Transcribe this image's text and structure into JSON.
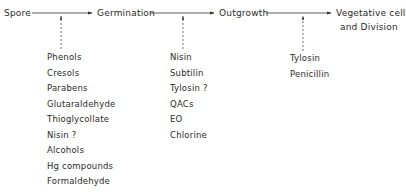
{
  "diagram": {
    "stages": [
      {
        "label": "Spore"
      },
      {
        "label": "Germination"
      },
      {
        "label": "Outgrowth"
      },
      {
        "label_line1": "Vegetative cell",
        "label_line2": "and Division"
      }
    ],
    "inhibitors": {
      "spore_to_germination": [
        "Phenols",
        "Cresols",
        "Parabens",
        "Glutaraldehyde",
        "Thioglycollate",
        "Nisin ?",
        "Alcohols",
        "Hg compounds",
        "Formaldehyde"
      ],
      "germination_to_outgrowth": [
        "Nisin",
        "Subtilin",
        "Tylosin ?",
        "QACs",
        "EO",
        "Chlorine"
      ],
      "outgrowth_to_vegetative": [
        "Tylosin",
        "Penicillin"
      ]
    },
    "colors": {
      "line": "#333333",
      "text": "#2a2a2a"
    }
  }
}
